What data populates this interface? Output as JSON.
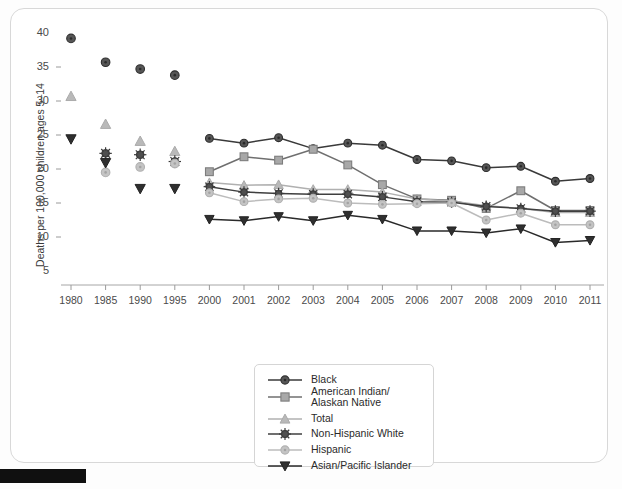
{
  "chart_data": {
    "type": "line",
    "title": "",
    "xlabel": "",
    "ylabel": "Deaths per 100,000 children ages 5–14",
    "categories": [
      "1980",
      "1985",
      "1990",
      "1995",
      "2000",
      "2001",
      "2002",
      "2003",
      "2004",
      "2005",
      "2006",
      "2007",
      "2008",
      "2009",
      "2010",
      "2011"
    ],
    "ylim": [
      3,
      41
    ],
    "yticks": [
      5,
      10,
      15,
      20,
      25,
      30,
      35,
      40
    ],
    "grid": false,
    "legend_position": "bottom-center",
    "note": "Early years 1980–1995 are unconnected marker-only points; 2000–2011 are connected lines.",
    "series": [
      {
        "name": "Black",
        "marker": "circle",
        "color": "#565656",
        "line_color": "#3a3a3a",
        "values": [
          39.2,
          35.7,
          34.7,
          33.8,
          24.5,
          23.8,
          24.6,
          23.0,
          23.8,
          23.5,
          21.4,
          21.2,
          20.2,
          20.4,
          18.2,
          18.6
        ]
      },
      {
        "name": "American Indian/\nAlaskan Native",
        "label_line1": "American Indian/",
        "label_line2": "Alaskan Native",
        "marker": "square",
        "color": "#a8a8a8",
        "line_color": "#6f6f6f",
        "values": [
          null,
          null,
          null,
          null,
          19.6,
          21.8,
          21.3,
          22.9,
          20.6,
          17.7,
          15.6,
          15.4,
          14.2,
          16.8,
          13.9,
          13.9
        ]
      },
      {
        "name": "Total",
        "marker": "triangle-up",
        "color": "#b9b9b9",
        "line_color": "#b0b0b0",
        "values": [
          30.7,
          26.6,
          24.1,
          22.6,
          18.0,
          17.6,
          17.7,
          17.0,
          17.0,
          16.6,
          15.6,
          15.3,
          14.6,
          14.2,
          13.6,
          13.6
        ]
      },
      {
        "name": "Non-Hispanic White",
        "marker": "starburst",
        "color": "#4f4f4f",
        "line_color": "#3f3f3f",
        "values": [
          null,
          22.3,
          22.1,
          21.1,
          17.4,
          16.6,
          16.4,
          16.3,
          16.3,
          15.9,
          15.2,
          15.1,
          14.5,
          14.2,
          13.8,
          13.8
        ]
      },
      {
        "name": "Hispanic",
        "marker": "circle-light",
        "color": "#c4c4c4",
        "line_color": "#bcbcbc",
        "values": [
          null,
          19.5,
          20.3,
          20.8,
          16.5,
          15.2,
          15.6,
          15.7,
          15.0,
          14.8,
          14.9,
          15.0,
          12.5,
          13.5,
          11.8,
          11.8
        ]
      },
      {
        "name": "Asian/Pacific Islander",
        "marker": "triangle-down",
        "color": "#2f2f2f",
        "line_color": "#2a2a2a",
        "values": [
          24.4,
          20.9,
          17.1,
          17.1,
          12.6,
          12.4,
          13.0,
          12.4,
          13.2,
          12.6,
          10.9,
          10.9,
          10.6,
          11.2,
          9.2,
          9.5
        ]
      }
    ]
  },
  "legend": {
    "items": [
      {
        "label": "Black"
      },
      {
        "label": "American Indian/",
        "label2": "Alaskan Native"
      },
      {
        "label": "Total"
      },
      {
        "label": "Non-Hispanic White"
      },
      {
        "label": "Hispanic"
      },
      {
        "label": "Asian/Pacific Islander"
      }
    ]
  }
}
